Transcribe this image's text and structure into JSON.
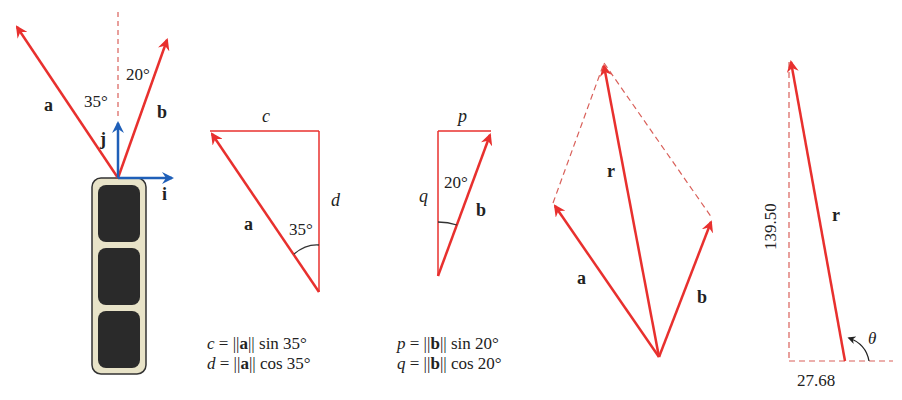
{
  "colors": {
    "vector_red": "#e8302e",
    "dashed_red": "#d9605a",
    "unit_blue": "#1f5fb8",
    "panel_bg": "#e8e3c8",
    "panel_dark": "#2a2a2a",
    "text": "#222222"
  },
  "panel1": {
    "vector_a_label": "a",
    "vector_b_label": "b",
    "unit_i_label": "i",
    "unit_j_label": "j",
    "angle_a": "35°",
    "angle_b": "20°"
  },
  "panel2": {
    "side_c_label": "c",
    "side_d_label": "d",
    "vector_label": "a",
    "angle": "35°",
    "eq1": {
      "lhs": "c",
      "mid": " = ||",
      "vec": "a",
      "rhs": "|| sin 35°"
    },
    "eq2": {
      "lhs": "d",
      "mid": " = ||",
      "vec": "a",
      "rhs": "|| cos 35°"
    }
  },
  "panel3": {
    "side_p_label": "p",
    "side_q_label": "q",
    "vector_label": "b",
    "angle": "20°",
    "eq1": {
      "lhs": "p",
      "mid": " = ||",
      "vec": "b",
      "rhs": "|| sin 20°"
    },
    "eq2": {
      "lhs": "q",
      "mid": " = ||",
      "vec": "b",
      "rhs": "|| cos 20°"
    }
  },
  "panel4": {
    "vector_a_label": "a",
    "vector_b_label": "b",
    "resultant_label": "r"
  },
  "panel5": {
    "resultant_label": "r",
    "vertical_component": "139.50",
    "horizontal_component": "27.68",
    "angle_label": "θ"
  }
}
